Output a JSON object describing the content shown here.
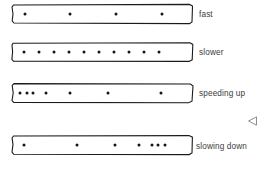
{
  "diagram": {
    "ink_color": "#151515",
    "tape_fill": "#ffffff",
    "label_color": "#3b3b3b",
    "tape_left_px": 11,
    "tape_width_px": 183,
    "tape_height_px": 22
  },
  "rows": [
    {
      "id": "fast",
      "label": "fast",
      "dot_count": 4,
      "spacing": "even-wide",
      "dots_x_pct": [
        7.5,
        32.5,
        57.5,
        82.5
      ]
    },
    {
      "id": "slower",
      "label": "slower",
      "dot_count": 10,
      "spacing": "even-tight",
      "dots_x_pct": [
        7.0,
        15.2,
        23.4,
        31.6,
        39.8,
        48.0,
        56.2,
        64.4,
        72.6,
        80.8
      ]
    },
    {
      "id": "speeding-up",
      "label": "speeding up",
      "dot_count": 7,
      "spacing": "increasing",
      "dots_x_pct": [
        5.0,
        8.5,
        12.0,
        19.0,
        32.0,
        53.0,
        82.0
      ]
    },
    {
      "id": "slowing-down",
      "label": "slowing down",
      "dot_count": 7,
      "spacing": "decreasing",
      "dots_x_pct": [
        7.0,
        36.0,
        57.0,
        70.0,
        77.0,
        80.5,
        84.0
      ]
    }
  ],
  "cursor": {
    "name": "left-pointing-triangle",
    "glyph": "◁"
  }
}
